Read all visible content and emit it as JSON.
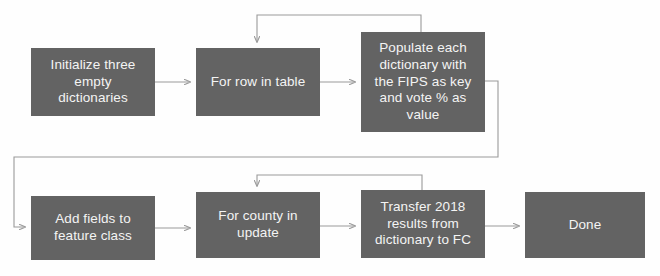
{
  "diagram": {
    "type": "flowchart",
    "canvas": {
      "width": 660,
      "height": 276
    },
    "colors": {
      "node_fill": "#636363",
      "node_text": "#f4f4f4",
      "connector": "#9a9a9a",
      "background": "#fefefe"
    },
    "nodes": [
      {
        "id": "initialize-dictionaries",
        "label": "Initialize three\nempty\ndictionaries",
        "x": 31,
        "y": 48,
        "w": 124,
        "h": 68
      },
      {
        "id": "for-row-in-table",
        "label": "For row in table",
        "x": 196,
        "y": 48,
        "w": 124,
        "h": 68
      },
      {
        "id": "populate-dictionary",
        "label": "Populate each\ndictionary with\nthe FIPS as key\nand vote % as\nvalue",
        "x": 361,
        "y": 32,
        "w": 124,
        "h": 100
      },
      {
        "id": "add-fields",
        "label": "Add fields to\nfeature class",
        "x": 31,
        "y": 196,
        "w": 124,
        "h": 64
      },
      {
        "id": "for-county-in-update",
        "label": "For county in\nupdate",
        "x": 196,
        "y": 192,
        "w": 124,
        "h": 66
      },
      {
        "id": "transfer-results",
        "label": "Transfer 2018\nresults from\ndictionary to FC",
        "x": 361,
        "y": 190,
        "w": 124,
        "h": 68
      },
      {
        "id": "done",
        "label": "Done",
        "x": 525,
        "y": 192,
        "w": 120,
        "h": 66
      }
    ],
    "edges": [
      {
        "id": "init-to-forrow",
        "from": "initialize-dictionaries",
        "to": "for-row-in-table",
        "arrow": true
      },
      {
        "id": "forrow-to-populate",
        "from": "for-row-in-table",
        "to": "populate-dictionary",
        "arrow": true
      },
      {
        "id": "populate-loop-back",
        "from": "populate-dictionary",
        "to": "for-row-in-table",
        "arrow": true
      },
      {
        "id": "populate-to-addfields",
        "from": "populate-dictionary",
        "to": "add-fields",
        "arrow": true
      },
      {
        "id": "addfields-to-forcounty",
        "from": "add-fields",
        "to": "for-county-in-update",
        "arrow": true
      },
      {
        "id": "forcounty-to-transfer",
        "from": "for-county-in-update",
        "to": "transfer-results",
        "arrow": true
      },
      {
        "id": "transfer-loop-back",
        "from": "transfer-results",
        "to": "for-county-in-update",
        "arrow": true
      },
      {
        "id": "transfer-to-done",
        "from": "transfer-results",
        "to": "done",
        "arrow": true
      }
    ]
  }
}
